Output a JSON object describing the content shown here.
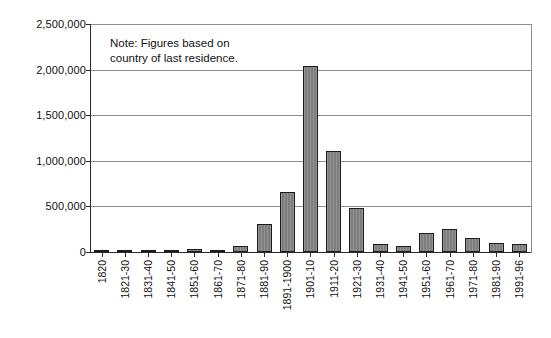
{
  "chart_data": {
    "type": "bar",
    "title": "",
    "subtitle": "",
    "xlabel": "",
    "ylabel": "",
    "ylim": [
      0,
      2500000
    ],
    "ytick_values": [
      0,
      500000,
      1000000,
      1500000,
      2000000,
      2500000
    ],
    "ytick_labels": [
      "0",
      "500,000",
      "1,000,000",
      "1,500,000",
      "2,000,000",
      "2,500,000"
    ],
    "grid": true,
    "legend": "none",
    "annotation": "Note: Figures based on\ncountry of last residence.",
    "bar_color": "#7d7d7d",
    "bar_edge_color": "#1c1c1c",
    "categories": [
      "1820",
      "1821-30",
      "1831-40",
      "1841-50",
      "1851-60",
      "1861-70",
      "1871-80",
      "1881-90",
      "1891-1900",
      "1901-10",
      "1911-20",
      "1921-30",
      "1931-40",
      "1941-50",
      "1951-60",
      "1961-70",
      "1971-80",
      "1981-90",
      "1991-96"
    ],
    "values": [
      8000,
      14000,
      25000,
      20000,
      30000,
      25000,
      65000,
      310000,
      660000,
      2045000,
      1110000,
      480000,
      85000,
      70000,
      210000,
      250000,
      155000,
      95000,
      85000
    ]
  }
}
